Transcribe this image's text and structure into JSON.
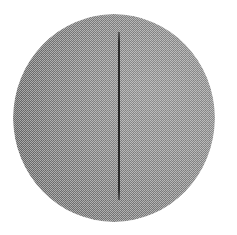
{
  "figure": {
    "title": "",
    "caption": "",
    "background_color": "#ffffff",
    "width": 237,
    "height": 235
  },
  "sphere": {
    "label": "spherical particle",
    "center_x": 114,
    "center_y": 118,
    "radius": 101,
    "bounds": {
      "left": 13,
      "top": 14,
      "right": 215,
      "bottom": 222
    },
    "fill_color": "#8d8d8d",
    "texture": "halftone-dither",
    "shading": "radial-highlight-upper-right"
  },
  "seam_line": {
    "label": "vertical seam line",
    "x": 118,
    "y_start": 32,
    "y_end": 200,
    "thickness": 2,
    "color": "#222222",
    "orientation": "vertical"
  },
  "annotations": {
    "scale_bar_text": "",
    "corner_label": ""
  }
}
